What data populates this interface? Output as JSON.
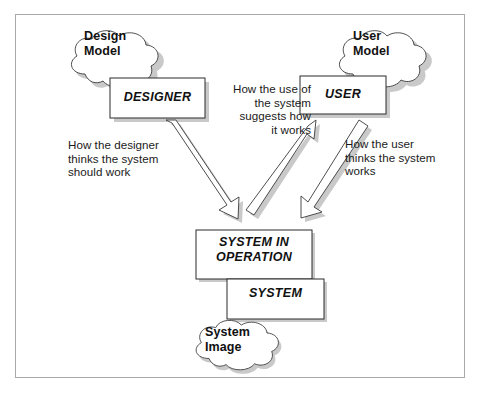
{
  "figure": {
    "frame_color": "#a8a8a8",
    "background": "#ffffff",
    "shadow_color": "#c9c9c9",
    "stroke_color": "#333333",
    "text_color": "#111111"
  },
  "clouds": [
    {
      "id": "design-model",
      "label": "Design\nModel"
    },
    {
      "id": "user-model",
      "label": "User\nModel"
    },
    {
      "id": "system-image",
      "label": "System\nImage"
    }
  ],
  "boxes": [
    {
      "id": "designer",
      "label": "DESIGNER"
    },
    {
      "id": "user",
      "label": "USER"
    },
    {
      "id": "system-in-operation",
      "label": "SYSTEM IN\nOPERATION"
    },
    {
      "id": "system",
      "label": "SYSTEM"
    }
  ],
  "captions": [
    {
      "id": "designer-caption",
      "text": "How the designer\nthinks the system\nshould work",
      "align": "left"
    },
    {
      "id": "middle-caption",
      "text": "How the use of\nthe system\nsuggests how\nit works",
      "align": "right"
    },
    {
      "id": "user-caption",
      "text": "How the user\nthinks the system\nworks",
      "align": "left"
    }
  ],
  "arrows": [
    {
      "id": "designer-to-system",
      "from": "designer",
      "to": "system-in-operation",
      "direction": "down-right"
    },
    {
      "id": "system-to-user-feedback",
      "from": "system-in-operation",
      "to": "user",
      "direction": "up-right"
    },
    {
      "id": "user-to-system",
      "from": "user",
      "to": "system-in-operation",
      "direction": "down-left"
    }
  ]
}
